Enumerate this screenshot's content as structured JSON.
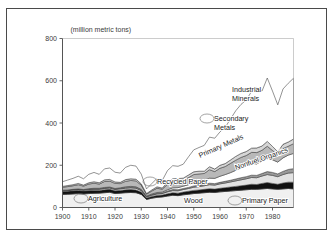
{
  "figure": {
    "unit_label": "(million metric tons)",
    "frame": "outer-border"
  },
  "chart_data": {
    "type": "area",
    "stacked": true,
    "title": "",
    "subtitle": "",
    "xlabel": "",
    "ylabel": "(million metric tons)",
    "unit": "million metric tons",
    "xlim": [
      1900,
      1988
    ],
    "ylim": [
      0,
      800
    ],
    "xticks": [
      1900,
      1910,
      1920,
      1930,
      1940,
      1950,
      1960,
      1970,
      1980
    ],
    "yticks": [
      0,
      200,
      400,
      600,
      800
    ],
    "grid": false,
    "legend": "inline-annotations",
    "x": [
      1900,
      1902,
      1904,
      1906,
      1908,
      1910,
      1912,
      1914,
      1916,
      1918,
      1920,
      1922,
      1924,
      1926,
      1928,
      1930,
      1932,
      1934,
      1936,
      1938,
      1940,
      1942,
      1944,
      1946,
      1948,
      1950,
      1952,
      1954,
      1956,
      1958,
      1960,
      1962,
      1964,
      1966,
      1968,
      1970,
      1972,
      1974,
      1976,
      1978,
      1980,
      1982,
      1984,
      1986,
      1988
    ],
    "series": [
      {
        "name": "Agriculture",
        "label": "Agriculture",
        "color": "#f0f0f0",
        "values": [
          62,
          63,
          64,
          66,
          64,
          66,
          67,
          68,
          70,
          72,
          66,
          68,
          70,
          71,
          70,
          62,
          38,
          44,
          48,
          50,
          54,
          58,
          56,
          60,
          63,
          66,
          68,
          70,
          72,
          71,
          74,
          76,
          78,
          80,
          82,
          84,
          86,
          86,
          88,
          90,
          88,
          86,
          88,
          90,
          88
        ]
      },
      {
        "name": "Wood",
        "label": "Wood",
        "color": "#111111",
        "values": [
          14,
          14,
          15,
          15,
          14,
          14,
          14,
          13,
          14,
          14,
          13,
          13,
          14,
          14,
          13,
          11,
          7,
          8,
          9,
          9,
          11,
          12,
          12,
          13,
          14,
          15,
          15,
          16,
          17,
          16,
          17,
          18,
          19,
          20,
          21,
          22,
          24,
          23,
          26,
          28,
          26,
          24,
          28,
          30,
          32
        ]
      },
      {
        "name": "Primary Paper",
        "label": "Primary Paper",
        "color": "#e2e2e2",
        "values": [
          3,
          3,
          4,
          4,
          4,
          5,
          5,
          5,
          6,
          6,
          6,
          7,
          7,
          8,
          8,
          7,
          5,
          6,
          7,
          7,
          9,
          10,
          11,
          12,
          13,
          15,
          16,
          17,
          19,
          19,
          21,
          22,
          24,
          26,
          28,
          30,
          32,
          32,
          35,
          38,
          38,
          36,
          40,
          43,
          45
        ]
      },
      {
        "name": "Recycled Paper",
        "label": "Recycled Paper",
        "color": "#9a9a9a",
        "values": [
          2,
          2,
          2,
          2,
          2,
          3,
          3,
          3,
          3,
          3,
          3,
          3,
          4,
          4,
          4,
          3,
          2,
          3,
          3,
          3,
          4,
          5,
          5,
          5,
          5,
          6,
          6,
          6,
          7,
          7,
          7,
          8,
          8,
          9,
          10,
          10,
          11,
          11,
          12,
          14,
          14,
          13,
          15,
          17,
          19
        ]
      },
      {
        "name": "Nonfuel Organics",
        "label": "Nonfuel Organics",
        "color": "#ffffff",
        "values": [
          1,
          1,
          1,
          1,
          1,
          1,
          2,
          2,
          2,
          2,
          2,
          2,
          3,
          3,
          3,
          3,
          2,
          3,
          4,
          4,
          6,
          8,
          10,
          11,
          13,
          16,
          18,
          20,
          24,
          25,
          29,
          32,
          36,
          41,
          46,
          50,
          56,
          54,
          60,
          66,
          60,
          56,
          64,
          68,
          72
        ]
      },
      {
        "name": "Primary Metals",
        "label": "Primary Metals",
        "color": "#b8b8b8",
        "values": [
          14,
          16,
          17,
          20,
          16,
          22,
          24,
          20,
          28,
          28,
          24,
          20,
          26,
          28,
          28,
          20,
          9,
          14,
          20,
          14,
          26,
          32,
          32,
          28,
          34,
          38,
          36,
          32,
          40,
          32,
          38,
          38,
          44,
          48,
          50,
          50,
          52,
          54,
          50,
          54,
          44,
          34,
          44,
          42,
          46
        ]
      },
      {
        "name": "Secondary Metals",
        "label": "Secondary Metals",
        "color": "#d6d6d6",
        "values": [
          4,
          5,
          5,
          6,
          5,
          6,
          7,
          6,
          8,
          8,
          7,
          6,
          8,
          8,
          8,
          6,
          3,
          5,
          7,
          5,
          9,
          11,
          11,
          10,
          12,
          13,
          13,
          11,
          14,
          12,
          14,
          14,
          16,
          18,
          19,
          19,
          20,
          22,
          20,
          23,
          19,
          15,
          20,
          20,
          22
        ]
      },
      {
        "name": "Industrial Minerals",
        "label": "Industrial Minerals",
        "color": "#ffffff",
        "values": [
          22,
          26,
          30,
          34,
          30,
          40,
          44,
          40,
          52,
          54,
          46,
          44,
          58,
          64,
          62,
          46,
          22,
          30,
          40,
          36,
          56,
          62,
          58,
          66,
          86,
          104,
          112,
          122,
          140,
          146,
          158,
          172,
          194,
          216,
          232,
          244,
          268,
          286,
          260,
          300,
          262,
          222,
          262,
          278,
          288
        ]
      }
    ],
    "annotations": [
      {
        "text": "Industrial Minerals",
        "x_px": 232,
        "y_px": 92,
        "rotation": 0,
        "leader": false
      },
      {
        "text": "Secondary Metals",
        "x_px": 214,
        "y_px": 121,
        "rotation": 0,
        "leader": true
      },
      {
        "text": "Primary Metals",
        "x_px": 200,
        "y_px": 158,
        "rotation": -24,
        "leader": false
      },
      {
        "text": "Nonfuel Organics",
        "x_px": 236,
        "y_px": 170,
        "rotation": -19,
        "leader": false
      },
      {
        "text": "Recycled Paper",
        "x_px": 157,
        "y_px": 184,
        "rotation": 0,
        "leader": true
      },
      {
        "text": "Agriculture",
        "x_px": 88,
        "y_px": 201,
        "rotation": 0,
        "leader": true
      },
      {
        "text": "Wood",
        "x_px": 184,
        "y_px": 203,
        "rotation": 0,
        "leader": false
      },
      {
        "text": "Primary Paper",
        "x_px": 242,
        "y_px": 203,
        "rotation": 0,
        "leader": true
      }
    ]
  }
}
